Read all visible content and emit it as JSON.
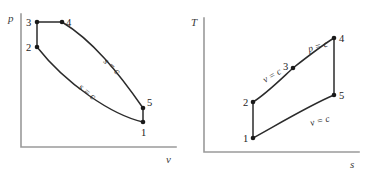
{
  "figure": {
    "kind": "thermodynamic-cycle-diagrams",
    "panel_count": 2
  },
  "pv_panel": {
    "axes": {
      "y_label": "p",
      "x_label": "v",
      "origin": [
        21,
        147
      ],
      "y_top": [
        21,
        14
      ],
      "x_right": [
        176,
        147
      ]
    },
    "states": [
      {
        "id": "1",
        "label": "1",
        "x": 143,
        "y": 122,
        "label_x": 141,
        "label_y": 136
      },
      {
        "id": "2",
        "label": "2",
        "x": 37,
        "y": 47,
        "label_x": 26,
        "label_y": 51
      },
      {
        "id": "3",
        "label": "3",
        "x": 37,
        "y": 22,
        "label_x": 26,
        "label_y": 26
      },
      {
        "id": "4",
        "label": "4",
        "x": 62,
        "y": 22,
        "label_x": 66,
        "label_y": 26
      },
      {
        "id": "5",
        "label": "5",
        "x": 143,
        "y": 108,
        "label_x": 147,
        "label_y": 106
      }
    ],
    "process_labels": [
      {
        "text": "s = c",
        "x": 103,
        "y": 62,
        "rotation": 43
      },
      {
        "text": "s = c",
        "x": 78,
        "y": 88,
        "rotation": 40
      }
    ]
  },
  "ts_panel": {
    "axes": {
      "y_label": "T",
      "x_label": "s",
      "origin": [
        204,
        152
      ],
      "y_top": [
        204,
        18
      ],
      "x_right": [
        359,
        152
      ]
    },
    "states": [
      {
        "id": "1",
        "label": "1",
        "x": 253,
        "y": 138,
        "label_x": 243,
        "label_y": 142
      },
      {
        "id": "2",
        "label": "2",
        "x": 253,
        "y": 102,
        "label_x": 243,
        "label_y": 106
      },
      {
        "id": "3",
        "label": "3",
        "x": 293,
        "y": 68,
        "label_x": 283,
        "label_y": 70
      },
      {
        "id": "4",
        "label": "4",
        "x": 334,
        "y": 38,
        "label_x": 339,
        "label_y": 42
      },
      {
        "id": "5",
        "label": "5",
        "x": 334,
        "y": 95,
        "label_x": 339,
        "label_y": 99
      }
    ],
    "process_labels": [
      {
        "text": "p = c",
        "x": 309,
        "y": 52,
        "rotation": -16
      },
      {
        "text": "v = c",
        "x": 265,
        "y": 83,
        "rotation": -30
      },
      {
        "text": "v = c",
        "x": 311,
        "y": 126,
        "rotation": -14
      }
    ]
  },
  "colors": {
    "curve": "#2b2b2b",
    "axis": "#9a9a9a",
    "dot": "#1a1a1a",
    "background": "#ffffff"
  }
}
